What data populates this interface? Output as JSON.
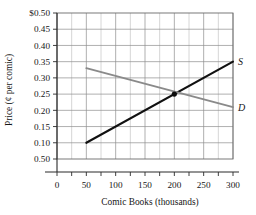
{
  "chart_data": {
    "type": "line",
    "title": "",
    "xlabel": "Comic Books (thousands)",
    "ylabel": "Price (¢ per comic)",
    "xlim": [
      0,
      300
    ],
    "ylim": [
      0.05,
      0.5
    ],
    "grid": true,
    "legend_position": "inline-right-of-curve-ends",
    "x_ticks": [
      {
        "value": 0,
        "label": "0"
      },
      {
        "value": 50,
        "label": "50"
      },
      {
        "value": 100,
        "label": "100"
      },
      {
        "value": 150,
        "label": "150"
      },
      {
        "value": 200,
        "label": "200"
      },
      {
        "value": 250,
        "label": "250"
      },
      {
        "value": 300,
        "label": "300"
      }
    ],
    "x_minor_ticks": [
      25,
      75,
      125,
      175,
      225,
      275
    ],
    "y_ticks": [
      {
        "value": 0.5,
        "label": "$0.50"
      },
      {
        "value": 0.45,
        "label": "0.45"
      },
      {
        "value": 0.4,
        "label": "0.40"
      },
      {
        "value": 0.35,
        "label": "0.35"
      },
      {
        "value": 0.3,
        "label": "0.30"
      },
      {
        "value": 0.25,
        "label": "0.25"
      },
      {
        "value": 0.2,
        "label": "0.20"
      },
      {
        "value": 0.15,
        "label": "0.15"
      },
      {
        "value": 0.1,
        "label": "0.10"
      },
      {
        "value": 0.05,
        "label": "0.50"
      }
    ],
    "series": [
      {
        "name": "S",
        "label": "S",
        "color": "#111111",
        "x": [
          50,
          300
        ],
        "values": [
          0.1,
          0.35
        ]
      },
      {
        "name": "D",
        "label": "D",
        "color": "#8a8a8a",
        "x": [
          50,
          300
        ],
        "values": [
          0.33,
          0.21
        ]
      }
    ],
    "annotations": [
      {
        "name": "equilibrium-point",
        "x": 200,
        "y": 0.25,
        "label": ""
      }
    ]
  }
}
